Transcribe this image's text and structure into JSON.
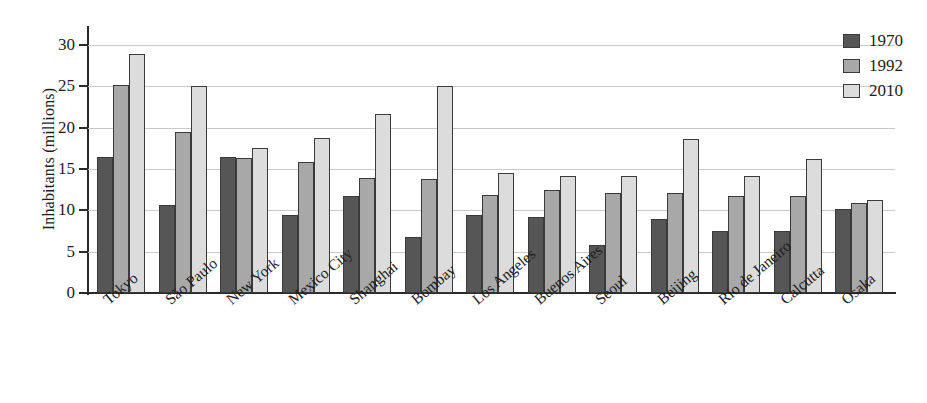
{
  "chart_data": {
    "type": "bar",
    "title": "",
    "subtitle": "",
    "xlabel": "",
    "ylabel": "Inhabitants (millions)",
    "ylim": [
      0,
      30
    ],
    "yticks": [
      0,
      5,
      10,
      15,
      20,
      25,
      30
    ],
    "grid": "horizontal",
    "legend_position": "top-right",
    "categories": [
      "Tokyo",
      "São Paulo",
      "New York",
      "Mexico City",
      "Shanghai",
      "Bombay",
      "Los Angeles",
      "Buenos Aires",
      "Seoul",
      "Beijing",
      "Rio de Janeiro",
      "Calcutta",
      "Osaka"
    ],
    "series": [
      {
        "name": "1970",
        "color": "#565656",
        "values": [
          16.5,
          10.7,
          16.4,
          9.4,
          11.7,
          6.8,
          9.4,
          9.2,
          5.8,
          9.0,
          7.5,
          7.5,
          10.2
        ]
      },
      {
        "name": "1992",
        "color": "#a8a8a8",
        "values": [
          25.2,
          19.5,
          16.3,
          15.9,
          13.9,
          13.8,
          11.9,
          12.5,
          12.1,
          12.1,
          11.7,
          11.7,
          10.9
        ]
      },
      {
        "name": "2010",
        "color": "#dcdcdc",
        "values": [
          28.9,
          25.0,
          17.6,
          18.7,
          21.7,
          25.0,
          14.5,
          14.1,
          14.1,
          18.6,
          14.1,
          16.2,
          11.3
        ]
      }
    ]
  },
  "legend": {
    "items": [
      {
        "label": "1970",
        "color": "#565656"
      },
      {
        "label": "1992",
        "color": "#a8a8a8"
      },
      {
        "label": "2010",
        "color": "#dcdcdc"
      }
    ]
  },
  "axis": {
    "y_title": "Inhabitants (millions)"
  }
}
